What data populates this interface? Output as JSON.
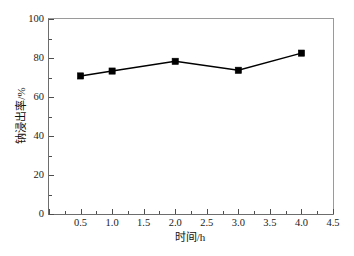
{
  "chart_data": {
    "type": "line",
    "title": "",
    "subtitle": "",
    "xlabel": "时间/h",
    "ylabel": "钠浸出率/%",
    "x": [
      0.5,
      1.0,
      2.0,
      3.0,
      4.0
    ],
    "series": [
      {
        "name": "钠浸出率",
        "values": [
          70.8,
          73.3,
          78.3,
          73.7,
          82.5
        ],
        "marker": "filled-square",
        "color": "#000000"
      }
    ],
    "xlim": [
      0.0,
      4.5
    ],
    "ylim": [
      0,
      100
    ],
    "xticks": [
      0.0,
      0.5,
      1.0,
      1.5,
      2.0,
      2.5,
      3.0,
      3.5,
      4.0,
      4.5
    ],
    "xtick_labels": [
      "",
      "0.5",
      "1.0",
      "1.5",
      "2.0",
      "2.5",
      "3.0",
      "3.5",
      "4.0",
      "4.5"
    ],
    "xticks_minor": [
      0.25,
      0.75,
      1.25,
      1.75,
      2.25,
      2.75,
      3.25,
      3.75,
      4.25
    ],
    "yticks": [
      0,
      20,
      40,
      60,
      80,
      100
    ],
    "ytick_labels": [
      "0",
      "20",
      "40",
      "60",
      "80",
      "100"
    ],
    "yticks_minor": [
      10,
      30,
      50,
      70,
      90
    ],
    "grid": false,
    "legend": "none",
    "line_color": "#000000",
    "marker_color": "#000000",
    "axis_color": "#6d6d6d",
    "background": "#ffffff"
  }
}
